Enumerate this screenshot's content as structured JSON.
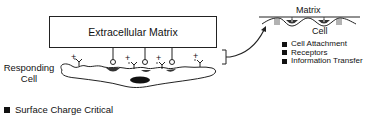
{
  "diagram": {
    "matrix_box_label": "Extracellular Matrix",
    "cell_label_line1": "Responding",
    "cell_label_line2": "Cell",
    "charges": [
      "+",
      "+",
      "+",
      "+"
    ],
    "inset": {
      "top_label": "Matrix",
      "bottom_label": "Cell"
    },
    "inset_legend": [
      {
        "label": "Cell Attachment",
        "icon": "square-bullet"
      },
      {
        "label": "Receptors",
        "icon": "square-bullet"
      },
      {
        "label": "Information Transfer",
        "icon": "square-bullet"
      }
    ],
    "bottom_legend": [
      {
        "label": "Surface Charge Critical",
        "icon": "square-bullet"
      }
    ]
  }
}
